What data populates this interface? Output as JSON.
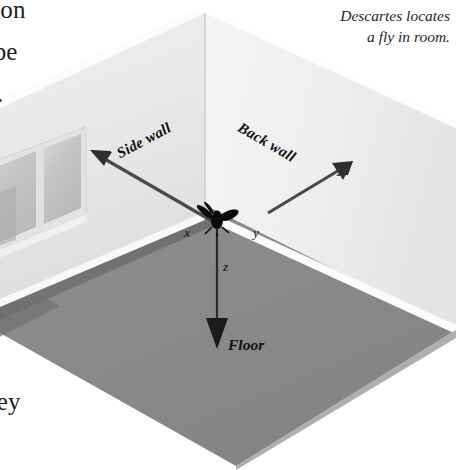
{
  "page": {
    "width": 456,
    "height": 470,
    "background": "#ffffff"
  },
  "caption": {
    "line1": "Descartes locates",
    "line2": "a fly in room."
  },
  "body_text": {
    "line1": "tion",
    "line2": "ribe",
    "line3": "y.",
    "line4": "hey"
  },
  "diagram": {
    "labels": {
      "side_wall": "Side wall",
      "back_wall": "Back wall",
      "floor": "Floor",
      "axis_x": "x",
      "axis_y": "y",
      "axis_z": "z"
    },
    "colors": {
      "left_wall": "#e8e8e8",
      "back_wall": "#f1f1f1",
      "floor": "#8a8a8a",
      "floor_shadow": "#707070",
      "baseboard": "#fbfbfb",
      "arrow": "#3b3b3b",
      "fly": "#0a0a0a",
      "window_glass": "#cdcdcd",
      "window_frame": "#dcdcdc"
    }
  }
}
